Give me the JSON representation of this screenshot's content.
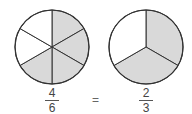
{
  "diagram": {
    "colors": {
      "shaded": "#d9d9d9",
      "unshaded": "#ffffff",
      "stroke": "#333333"
    },
    "left": {
      "slices": 6,
      "shaded_indices": [
        0,
        1,
        2,
        3
      ],
      "fraction": {
        "numerator": "4",
        "denominator": "6"
      }
    },
    "equals": "=",
    "right": {
      "slices": 3,
      "shaded_indices": [
        0,
        1
      ],
      "fraction": {
        "numerator": "2",
        "denominator": "3"
      }
    }
  }
}
